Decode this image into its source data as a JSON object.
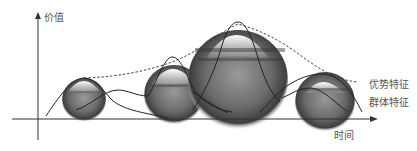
{
  "diagram": {
    "y_axis_label": "价值",
    "x_axis_label": "时间",
    "legend": [
      {
        "label": "优势特征",
        "style": "dashed"
      },
      {
        "label": "群体特征",
        "style": "solid"
      }
    ],
    "colors": {
      "axis": "#333333",
      "curve": "#222222",
      "text": "#555555",
      "sphere_dark": "#3a3a3a",
      "sphere_light": "#f2f2f2"
    },
    "spheres": [
      {
        "cx": 84,
        "cy": 100,
        "r": 20
      },
      {
        "cx": 174,
        "cy": 95,
        "r": 27
      },
      {
        "cx": 238,
        "cy": 78,
        "r": 45
      },
      {
        "cx": 325,
        "cy": 100,
        "r": 27
      }
    ]
  }
}
